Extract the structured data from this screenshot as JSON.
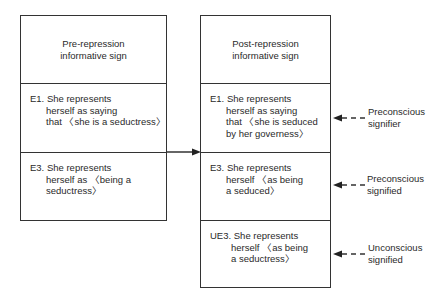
{
  "left_box": {
    "header": [
      "Pre-repression",
      "informative sign"
    ],
    "entries": [
      {
        "label": "E1.",
        "lines": [
          "She represents",
          "herself as saying",
          "that 〈she is a seductress〉"
        ]
      },
      {
        "label": "E3.",
        "lines": [
          "She represents",
          "herself as 〈being a",
          "seductress〉"
        ]
      }
    ]
  },
  "right_box": {
    "header": [
      "Post-repression",
      "informative sign"
    ],
    "entries": [
      {
        "label": "E1.",
        "lines": [
          "She represents",
          "herself as saying",
          "that 〈she is seduced",
          "by her governess〉"
        ]
      },
      {
        "label": "E3.",
        "lines": [
          "She represents",
          "herself 〈as being",
          "a seduced〉"
        ]
      },
      {
        "label": "UE3.",
        "lines": [
          "She represents",
          "herself 〈as being",
          "a seductress〉"
        ]
      }
    ]
  },
  "annotations": [
    {
      "lines": [
        "Preconscious",
        "signifier"
      ]
    },
    {
      "lines": [
        "Preconscious",
        "signified"
      ]
    },
    {
      "lines": [
        "Unconscious",
        "signified"
      ]
    }
  ],
  "colors": {
    "line": "#333333",
    "text": "#2a2a2a"
  }
}
